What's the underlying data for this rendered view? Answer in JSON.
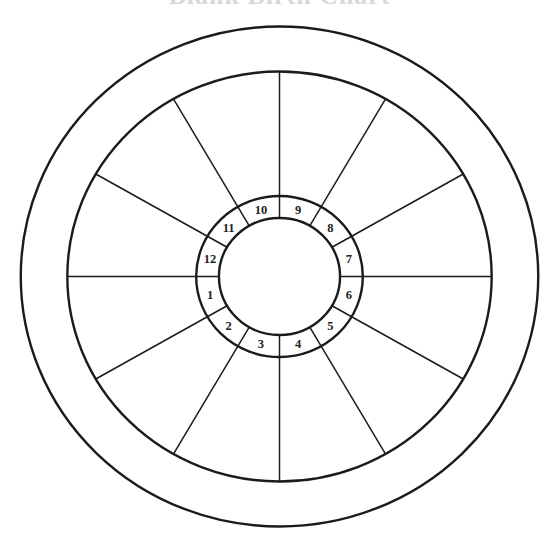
{
  "title": "Blank Birth Chart",
  "chart": {
    "center": {
      "x": 279.5,
      "y": 276.5
    },
    "x_scale": 1.035,
    "rings": {
      "outer_radius": 250,
      "zodiac_inner_radius": 205,
      "house_ring_outer_radius": 80.5,
      "house_ring_inner_radius": 58.5
    },
    "stroke_color": "#1b1b1b",
    "spoke_angles_deg": [
      0,
      30,
      60,
      90,
      120,
      150,
      180,
      210,
      240,
      270,
      300,
      330
    ],
    "houses": [
      {
        "number": "1"
      },
      {
        "number": "2"
      },
      {
        "number": "3"
      },
      {
        "number": "4"
      },
      {
        "number": "5"
      },
      {
        "number": "6"
      },
      {
        "number": "7"
      },
      {
        "number": "8"
      },
      {
        "number": "9"
      },
      {
        "number": "10"
      },
      {
        "number": "11"
      },
      {
        "number": "12"
      }
    ]
  }
}
